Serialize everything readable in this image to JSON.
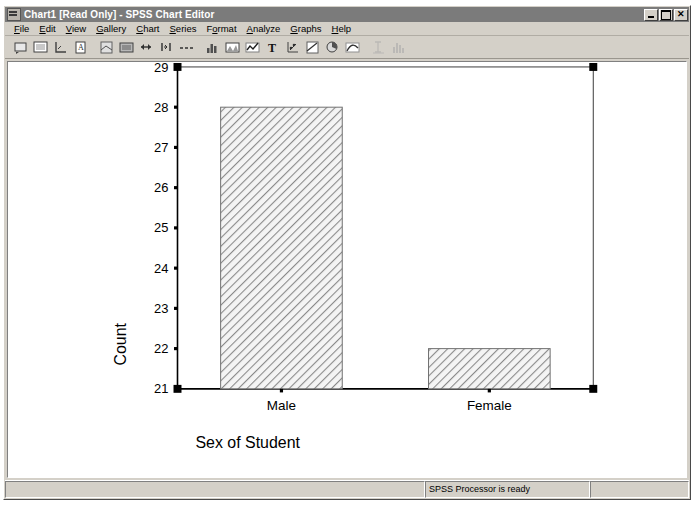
{
  "window": {
    "title": "Chart1 [Read Only] - SPSS Chart Editor",
    "icon": "chart-window-icon",
    "minimize_label": "_",
    "maximize_label": "❐",
    "close_label": "×"
  },
  "menubar": {
    "items": [
      {
        "label": "File",
        "accel": "F"
      },
      {
        "label": "Edit",
        "accel": "E"
      },
      {
        "label": "View",
        "accel": "V"
      },
      {
        "label": "Gallery",
        "accel": "G"
      },
      {
        "label": "Chart",
        "accel": "C"
      },
      {
        "label": "Series",
        "accel": "S"
      },
      {
        "label": "Format",
        "accel": "o"
      },
      {
        "label": "Analyze",
        "accel": "A"
      },
      {
        "label": "Graphs",
        "accel": "G"
      },
      {
        "label": "Help",
        "accel": "H"
      }
    ]
  },
  "toolbar": {
    "buttons": [
      {
        "name": "chart-options-icon",
        "tip": "Chart Options"
      },
      {
        "name": "fill-pattern-icon",
        "tip": "Fill Pattern"
      },
      {
        "name": "axis-icon",
        "tip": "Axis"
      },
      {
        "name": "text-style-icon",
        "tip": "Text Style"
      },
      {
        "separator": true
      },
      {
        "name": "spin-mode-icon",
        "tip": "Spin Mode"
      },
      {
        "name": "point-id-icon",
        "tip": "Point ID"
      },
      {
        "name": "swap-axes-icon",
        "tip": "Swap Axes"
      },
      {
        "name": "transpose-icon",
        "tip": "Transpose Data"
      },
      {
        "name": "break-line-icon",
        "tip": "Break Line"
      },
      {
        "separator": true
      },
      {
        "name": "bar-chart-icon",
        "tip": "Bar Chart"
      },
      {
        "name": "area-chart-icon",
        "tip": "Area Chart"
      },
      {
        "name": "line-chart-icon",
        "tip": "Line Chart"
      },
      {
        "name": "text-tool-icon",
        "tip": "Text Tool"
      },
      {
        "name": "scatter-icon",
        "tip": "Scatterplot"
      },
      {
        "name": "reference-line-icon",
        "tip": "Reference Line"
      },
      {
        "name": "pie-chart-icon",
        "tip": "Pie Chart"
      },
      {
        "name": "curve-fit-icon",
        "tip": "Curve Fit"
      },
      {
        "separator": true
      },
      {
        "name": "error-bar-icon",
        "tip": "Error Bars",
        "disabled": true
      },
      {
        "name": "histogram-icon",
        "tip": "Histogram",
        "disabled": true
      }
    ]
  },
  "statusbar": {
    "message": "SPSS Processor  is ready",
    "pane2": "",
    "pane3": ""
  },
  "chart_data": {
    "type": "bar",
    "title": "",
    "subtitle": "",
    "categories": [
      "Male",
      "Female"
    ],
    "values": [
      28,
      22
    ],
    "xlabel": "Sex of Student",
    "ylabel": "Count",
    "ylim": [
      21,
      29
    ],
    "yticks": [
      21,
      22,
      23,
      24,
      25,
      26,
      27,
      28,
      29
    ],
    "ytick_labels": [
      "21",
      "22",
      "23",
      "24",
      "25",
      "26",
      "27",
      "28",
      "29"
    ],
    "grid": false,
    "legend": false,
    "bar_fill": "diagonal-hatch",
    "bar_fill_color": "#f2f2f2",
    "bar_hatch_color": "#808080",
    "bar_border_color": "#707070",
    "axis_color": "#000000",
    "plot_background": "#ffffff",
    "selected": true,
    "selection_handle_color": "#000000"
  }
}
